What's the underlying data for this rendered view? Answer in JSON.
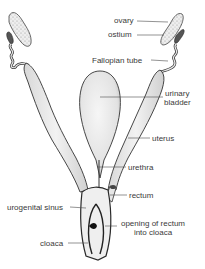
{
  "diagram": {
    "title": "",
    "colors": {
      "background": "#ffffff",
      "outline": "#2a2a2a",
      "fill": "#ededed",
      "label_text": "#3a3a3a",
      "leader_line": "#4a4a4a"
    },
    "labels": {
      "ovary": "ovary",
      "ostium": "ostium",
      "fallopian_tube": "Fallopian tube",
      "urinary_bladder_line1": "urinary",
      "urinary_bladder_line2": "bladder",
      "uterus": "uterus",
      "urethra": "urethra",
      "rectum": "rectum",
      "urogenital_sinus": "urogenital sinus",
      "opening_line1": "opening of rectum",
      "opening_line2": "into cloaca",
      "cloaca": "cloaca"
    }
  }
}
